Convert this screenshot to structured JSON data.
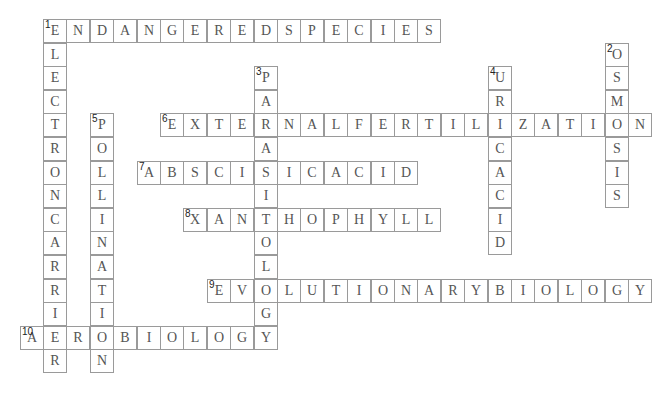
{
  "puzzle": {
    "type": "crossword",
    "grid": {
      "origin_x": 43,
      "origin_y": 19,
      "cell_w": 23.4,
      "cell_h": 23.6
    },
    "words": [
      {
        "number": "1",
        "answer": "ENDANGEREDSPECIES",
        "direction": "across",
        "row": 0,
        "col": 0
      },
      {
        "number": "1",
        "answer": "ELECTRONCARRIER",
        "direction": "down",
        "row": 0,
        "col": 0
      },
      {
        "number": "2",
        "answer": "OSMOSIS",
        "direction": "down",
        "row": 1,
        "col": 24
      },
      {
        "number": "3",
        "answer": "PARASITOLOGY",
        "direction": "down",
        "row": 2,
        "col": 9
      },
      {
        "number": "4",
        "answer": "URICACID",
        "direction": "down",
        "row": 2,
        "col": 19
      },
      {
        "number": "5",
        "answer": "POLLINATION",
        "direction": "down",
        "row": 4,
        "col": 2
      },
      {
        "number": "6",
        "answer": "EXTERNALFERTILIZATION",
        "direction": "across",
        "row": 4,
        "col": 5
      },
      {
        "number": "7",
        "answer": "ABSCISICACID",
        "direction": "across",
        "row": 6,
        "col": 4
      },
      {
        "number": "8",
        "answer": "XANTHOPHYLL",
        "direction": "across",
        "row": 8,
        "col": 6
      },
      {
        "number": "9",
        "answer": "EVOLUTIONARYBIOLOGY",
        "direction": "across",
        "row": 11,
        "col": 7
      },
      {
        "number": "10",
        "answer": "AEROBIOLOGY",
        "direction": "across",
        "row": 13,
        "col": -1
      }
    ]
  }
}
